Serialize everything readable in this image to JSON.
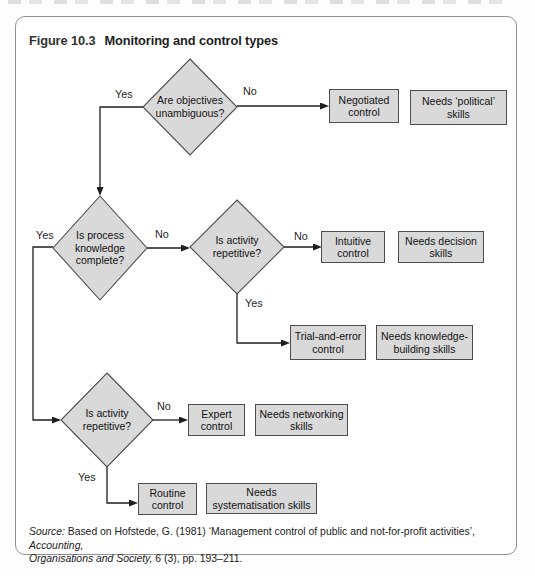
{
  "figure": {
    "label": "Figure 10.3",
    "title": "Monitoring and control types"
  },
  "flowchart": {
    "labels": {
      "yes": "Yes",
      "no": "No"
    },
    "decisions": [
      {
        "question": "Are objectives\nunambiguous?"
      },
      {
        "question": "Is process\nknowledge\ncomplete?"
      },
      {
        "question": "Is activity\nrepetitive?"
      },
      {
        "question": "Is activity\nrepetitive?"
      }
    ],
    "controls": [
      {
        "name": "Negotiated\ncontrol"
      },
      {
        "name": "Intuitive\ncontrol"
      },
      {
        "name": "Trial-and-error\ncontrol"
      },
      {
        "name": "Expert\ncontrol"
      },
      {
        "name": "Routine\ncontrol"
      }
    ],
    "skills": [
      {
        "name": "Needs ‘political’\nskills"
      },
      {
        "name": "Needs decision\nskills"
      },
      {
        "name": "Needs knowledge-\nbuilding skills"
      },
      {
        "name": "Needs networking\nskills"
      },
      {
        "name": "Needs\nsystematisation skills"
      }
    ]
  },
  "source": {
    "label": "Source:",
    "text1": " Based on Hofstede, G. (1981) ‘Management control of public and not-for-profit activities’, ",
    "journal1": "Accounting,",
    "journal2": "Organisations and Society,",
    "text2": " 6 (3), pp. 193–211."
  },
  "colors": {
    "shape_fill": "#d9d9d9",
    "shape_border": "#4d4d4d",
    "connector": "#1f1f1f",
    "frame_border": "#919191"
  }
}
